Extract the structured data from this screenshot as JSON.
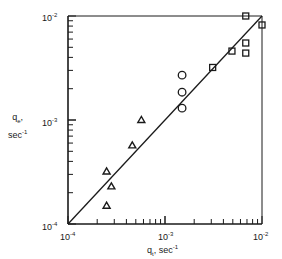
{
  "chart_data": {
    "type": "scatter",
    "title": "",
    "xlabel": "q_t, sec^-1",
    "ylabel": "q_e, sec^-1",
    "xscale": "log",
    "yscale": "log",
    "xlim": [
      0.0001,
      0.01
    ],
    "ylim": [
      0.0001,
      0.01
    ],
    "x_ticks": [
      "10^-4",
      "10^-3",
      "10^-2"
    ],
    "y_ticks": [
      "10^-4",
      "10^-3",
      "10^-2"
    ],
    "grid": false,
    "legend": null,
    "reference_line": {
      "type": "y=x",
      "from": [
        0.0001,
        0.0001
      ],
      "to": [
        0.01,
        0.01
      ]
    },
    "series": [
      {
        "name": "triangles",
        "marker": "triangle",
        "points": [
          [
            0.00057,
            0.001
          ],
          [
            0.00046,
            0.00057
          ],
          [
            0.00025,
            0.00032
          ],
          [
            0.00028,
            0.00023
          ],
          [
            0.00025,
            0.00015
          ]
        ]
      },
      {
        "name": "circles",
        "marker": "circle",
        "points": [
          [
            0.0015,
            0.0027
          ],
          [
            0.0015,
            0.00185
          ],
          [
            0.0015,
            0.0013
          ]
        ]
      },
      {
        "name": "squares",
        "marker": "square",
        "points": [
          [
            0.0031,
            0.0032
          ],
          [
            0.0049,
            0.0046
          ],
          [
            0.0068,
            0.0055
          ],
          [
            0.0068,
            0.0044
          ],
          [
            0.0068,
            0.01
          ],
          [
            0.01,
            0.0082
          ]
        ]
      }
    ]
  },
  "axes": {
    "x_label_main": "q",
    "x_label_sub": "t",
    "x_label_unit": ", sec",
    "y_label_main": "q",
    "y_label_sub": "e",
    "y_label_unit": "sec",
    "exp_neg1": "-1",
    "tick_base": "10",
    "tick_exp_m4": "-4",
    "tick_exp_m3": "-3",
    "tick_exp_m2": "-2"
  }
}
